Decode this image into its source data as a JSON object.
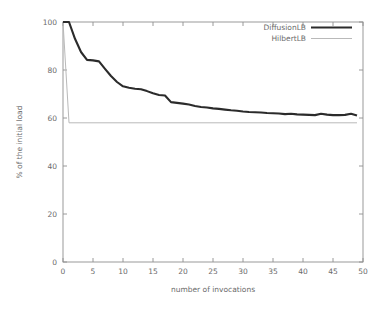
{
  "chart_data": {
    "type": "line",
    "title": "",
    "xlabel": "number of invocations",
    "ylabel": "% of the initial load",
    "xlim": [
      0,
      50
    ],
    "ylim": [
      0,
      100
    ],
    "xticks": [
      0,
      5,
      10,
      15,
      20,
      25,
      30,
      35,
      40,
      45,
      50
    ],
    "yticks": [
      0,
      20,
      40,
      60,
      80,
      100
    ],
    "xtick_labels": [
      "0",
      "5",
      "10",
      "15",
      "20",
      "25",
      "30",
      "35",
      "40",
      "45",
      "50"
    ],
    "ytick_labels": [
      "0",
      "20",
      "40",
      "60",
      "80",
      "100"
    ],
    "grid": false,
    "legend_position": "top-right",
    "legend": [
      "DiffusionLB",
      "HilbertLB"
    ],
    "x": [
      0,
      1,
      2,
      3,
      4,
      5,
      6,
      7,
      8,
      9,
      10,
      11,
      12,
      13,
      14,
      15,
      16,
      17,
      18,
      19,
      20,
      21,
      22,
      23,
      24,
      25,
      26,
      27,
      28,
      29,
      30,
      31,
      32,
      33,
      34,
      35,
      36,
      37,
      38,
      39,
      40,
      41,
      42,
      43,
      44,
      45,
      46,
      47,
      48,
      49
    ],
    "series": [
      {
        "name": "DiffusionLB",
        "color": "#2b2b2b",
        "line_width": "thick",
        "values": [
          100.0,
          100.0,
          93.0,
          87.5,
          84.2,
          84.0,
          83.6,
          80.5,
          77.5,
          75.0,
          73.2,
          72.6,
          72.2,
          72.0,
          71.2,
          70.3,
          69.6,
          69.4,
          66.6,
          66.3,
          66.0,
          65.6,
          65.0,
          64.6,
          64.4,
          64.0,
          63.8,
          63.5,
          63.2,
          63.0,
          62.7,
          62.5,
          62.4,
          62.3,
          62.1,
          62.0,
          61.9,
          61.6,
          61.8,
          61.5,
          61.4,
          61.3,
          61.2,
          61.8,
          61.4,
          61.2,
          61.2,
          61.3,
          61.8,
          61.0
        ]
      },
      {
        "name": "HilbertLB",
        "color": "#b9b9b9",
        "line_width": "thin",
        "values": [
          100.0,
          58.0,
          58.0,
          58.0,
          58.0,
          58.0,
          58.0,
          58.0,
          58.0,
          58.0,
          58.0,
          58.0,
          58.0,
          58.0,
          58.0,
          58.0,
          58.0,
          58.0,
          58.0,
          58.0,
          58.0,
          58.0,
          58.0,
          58.0,
          58.0,
          58.0,
          58.0,
          58.0,
          58.0,
          58.0,
          58.0,
          58.0,
          58.0,
          58.0,
          58.0,
          58.0,
          58.0,
          58.0,
          58.0,
          58.0,
          58.0,
          58.0,
          58.0,
          58.0,
          58.0,
          58.0,
          58.0,
          58.0,
          58.0,
          58.0
        ]
      }
    ]
  }
}
